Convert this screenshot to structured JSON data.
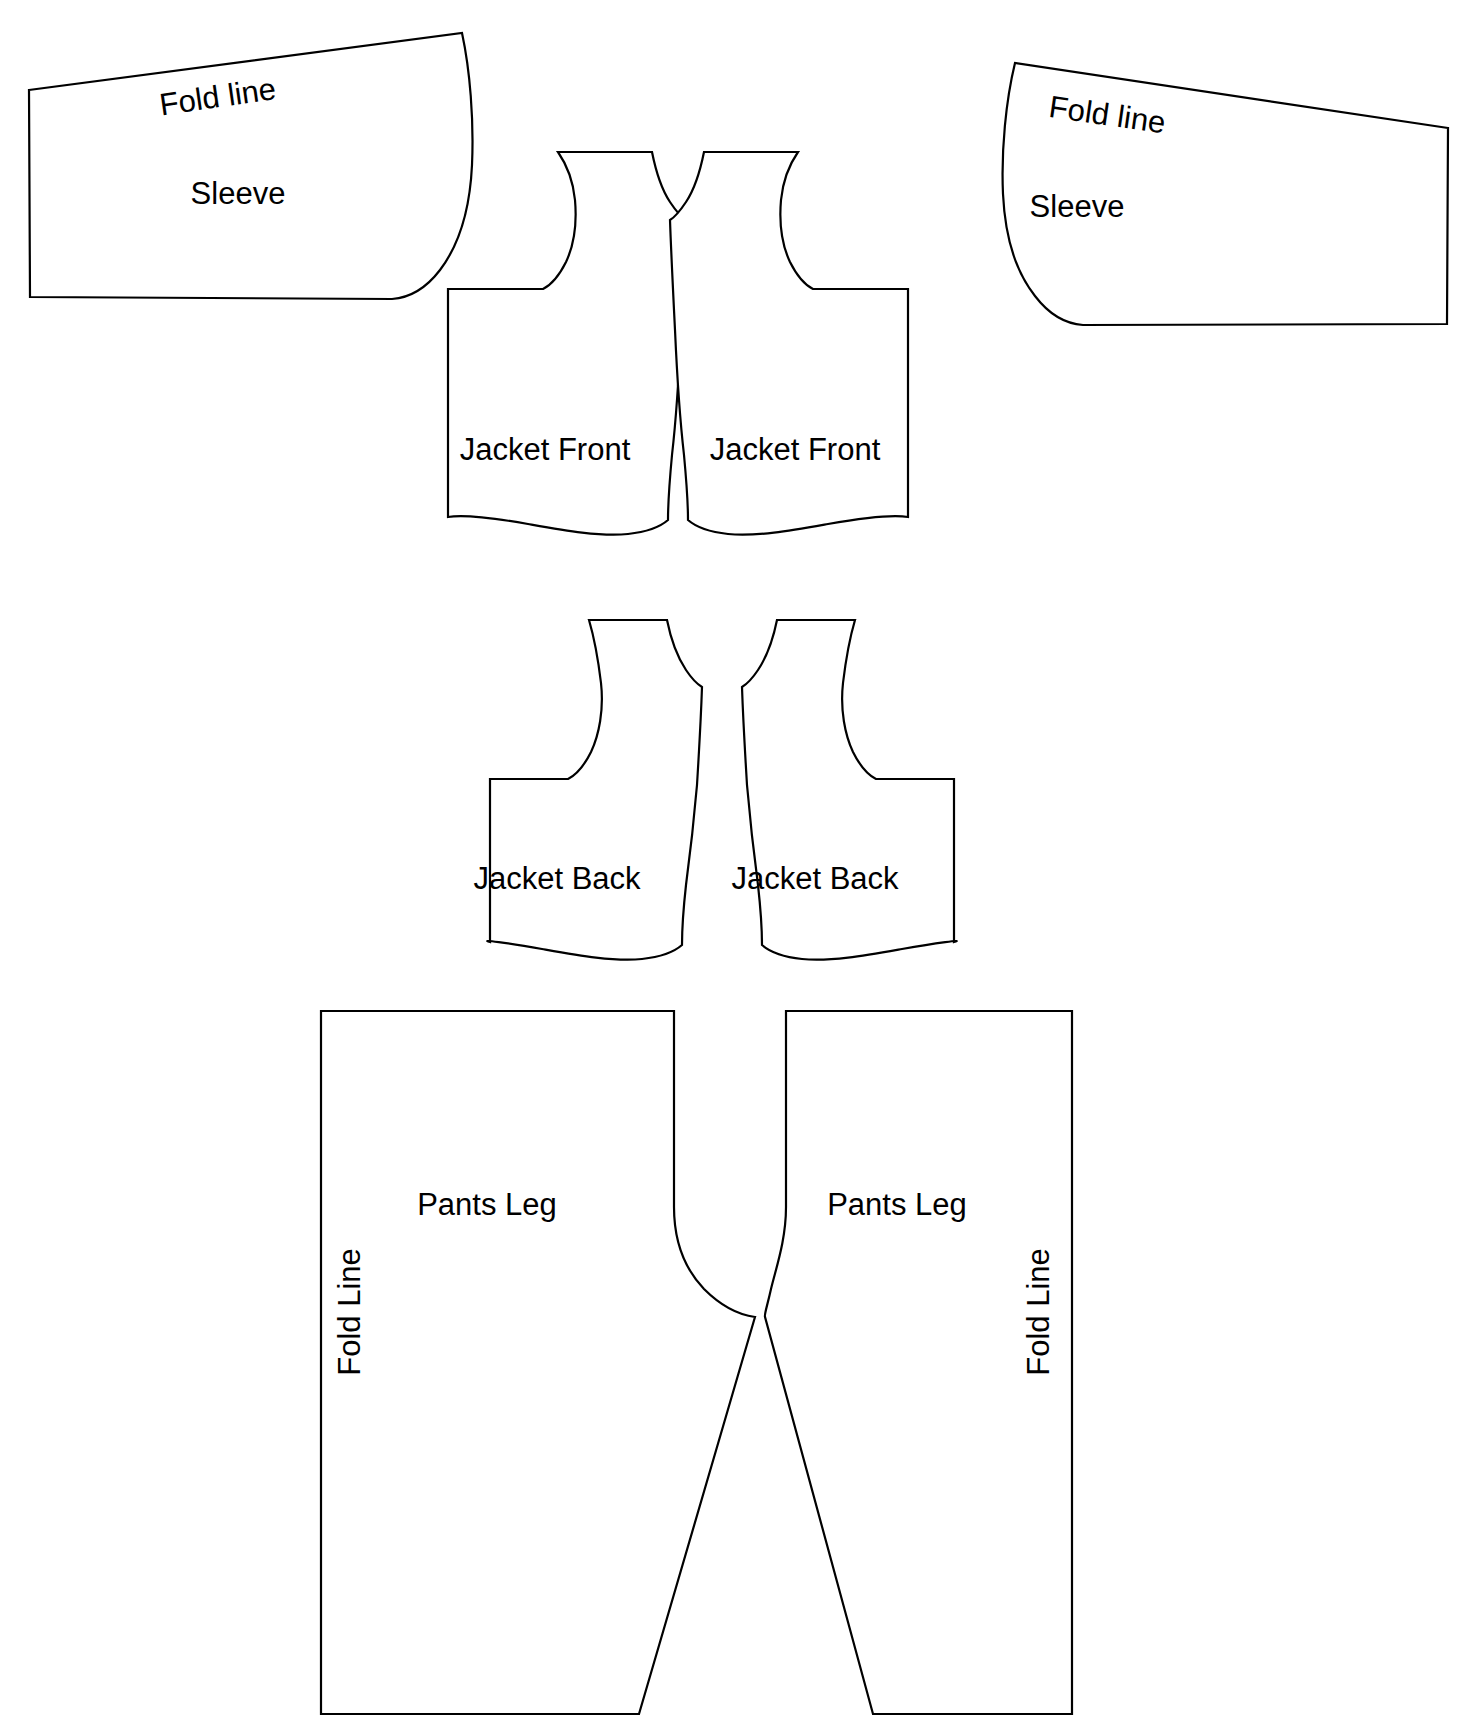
{
  "document": {
    "title": "Garment Sewing Pattern Layout",
    "type": "line-drawing",
    "background_color": "#ffffff",
    "line_color": "#000000"
  },
  "pieces": [
    {
      "id": "sleeve-left",
      "label": "Sleeve",
      "fold_label": "Fold line",
      "label_x": 238,
      "label_y": 196,
      "fold_x": 218,
      "fold_y": 99,
      "fold_rotation": -8.5
    },
    {
      "id": "sleeve-right",
      "label": "Sleeve",
      "fold_label": "Fold line",
      "label_x": 1077,
      "label_y": 209,
      "fold_x": 1105,
      "fold_y": 116,
      "fold_rotation": 8.5
    },
    {
      "id": "jacket-front-left",
      "label": "Jacket Front",
      "label_x": 545,
      "label_y": 452
    },
    {
      "id": "jacket-front-right",
      "label": "Jacket Front",
      "label_x": 795,
      "label_y": 452
    },
    {
      "id": "jacket-back-left",
      "label": "Jacket Back",
      "label_x": 557,
      "label_y": 881
    },
    {
      "id": "jacket-back-right",
      "label": "Jacket Back",
      "label_x": 815,
      "label_y": 881
    },
    {
      "id": "pants-leg-left",
      "label": "Pants Leg",
      "fold_label": "Fold Line",
      "label_x": 487,
      "label_y": 1207,
      "fold_x": 352,
      "fold_y": 1310,
      "fold_rotation": -90
    },
    {
      "id": "pants-leg-right",
      "label": "Pants Leg",
      "fold_label": "Fold Line",
      "label_x": 897,
      "label_y": 1207,
      "fold_x": 1041,
      "fold_y": 1310,
      "fold_rotation": -90
    }
  ],
  "geometry": {
    "sleeve_left_path": "M 29,88 L 463,33 C 472,108 470,180 450,230 C 432,275 408,292 390,298 L 30,297 Z",
    "sleeve_right_path": "M 1448,125 L 1014,63 C 1000,140 1000,208 1020,256 C 1038,300 1060,318 1078,325 L 1447,324 Z",
    "jacket_front_left_path": "M 556,150 L 621,150 C 623,175 629,195 640,210 C 648,222 655,228 662,232 C 660,300 666,380 670,440 C 673,480 673,505 670,522 C 640,535 600,532 560,525 C 520,518 480,510 450,512 L 450,288 L 545,288 C 558,278 568,260 572,238 C 576,215 571,185 556,150 Z",
    "jacket_front_right_path": "M 800,150 L 735,150 C 733,175 727,195 716,210 C 708,222 701,228 694,232 C 696,300 690,380 686,440 C 683,480 683,505 686,522 C 716,535 756,532 796,525 C 836,518 876,510 906,512 L 906,288 L 811,288 C 798,278 788,260 784,238 C 780,215 785,185 800,150 Z",
    "jacket_back_left_path": "M 590,620 L 662,620 C 664,648 670,668 680,682 C 687,692 694,698 700,702 C 698,770 702,830 706,880 C 710,915 712,935 710,948 C 680,962 640,958 600,951 C 560,944 520,936 490,938 L 490,778 L 570,778 C 583,768 593,750 597,728 C 601,705 600,668 590,620 Z",
    "jacket_back_right_path": "M 855,620 L 783,620 C 781,648 775,668 765,682 C 758,692 751,698 745,702 C 747,770 743,830 739,880 C 735,915 733,935 735,948 C 765,962 805,958 845,951 C 885,944 925,936 955,938 L 955,778 L 875,778 C 862,768 852,750 848,728 C 844,705 845,668 855,620 Z",
    "pants_leg_left_path": "M 321,1011 L 673,1011 L 673,1210 C 673,1250 700,1295 757,1316 L 640,1715 L 321,1715 Z",
    "pants_leg_right_path": "M 1072,1011 L 786,1011 L 786,1210 C 786,1250 759,1295 762,1316 L 872,1715 L 1072,1715 Z"
  },
  "icons": {
    "fold_marker": "fold-line-marker"
  }
}
